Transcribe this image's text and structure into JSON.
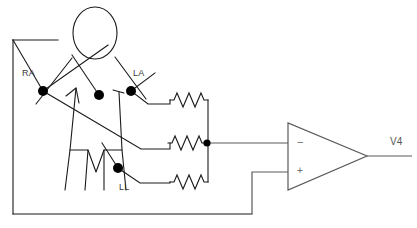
{
  "diagram": {
    "type": "electrical-schematic",
    "canvas": {
      "width": 417,
      "height": 228,
      "background": "#ffffff"
    },
    "colors": {
      "wire": "#1a1a1a",
      "body_outline": "#1a1a1a",
      "electrode_dot": "#000000",
      "opamp_outline": "#5a5a5a",
      "label_text": "#3a3a3a"
    },
    "electrodes": [
      {
        "id": "RA",
        "label": "RA",
        "name": "right-arm-electrode",
        "x": 43,
        "y": 91,
        "radius": 5
      },
      {
        "id": "MID",
        "label": "",
        "name": "center-electrode",
        "x": 99,
        "y": 95,
        "radius": 5
      },
      {
        "id": "LA",
        "label": "LA",
        "name": "left-arm-electrode",
        "x": 131,
        "y": 91,
        "radius": 5
      },
      {
        "id": "LL",
        "label": "LL",
        "name": "left-leg-electrode",
        "x": 118,
        "y": 168,
        "radius": 5
      }
    ],
    "resistors": [
      {
        "id": "R1",
        "name": "resistor-top",
        "x": 170,
        "y": 100,
        "width": 38,
        "source": "LA"
      },
      {
        "id": "R2",
        "name": "resistor-middle",
        "x": 170,
        "y": 143,
        "width": 38,
        "source": "RA"
      },
      {
        "id": "R3",
        "name": "resistor-bottom",
        "x": 170,
        "y": 182,
        "width": 38,
        "source": "LL"
      }
    ],
    "summing_node": {
      "name": "summing-node",
      "x": 207,
      "y": 143,
      "radius": 3.5
    },
    "opamp": {
      "name": "operational-amplifier",
      "inverting_label": "−",
      "noninverting_label": "+",
      "output_label": "V4",
      "apex_x": 367,
      "left_x": 288,
      "top_y": 123,
      "bottom_y": 190,
      "inverting_input_y": 143,
      "noninverting_input_y": 172,
      "output_y": 156
    },
    "figure": {
      "name": "patient-figure",
      "head": {
        "cx": 95,
        "cy": 33,
        "rx": 22,
        "ry": 26
      }
    }
  }
}
